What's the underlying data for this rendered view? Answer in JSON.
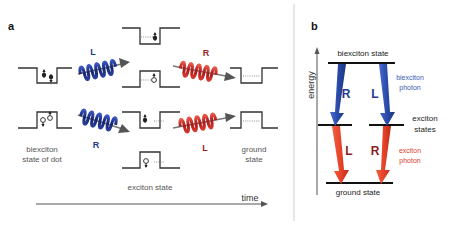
{
  "panel_a": {
    "label": "a",
    "captions": {
      "biexciton_line1": "biexciton",
      "biexciton_line2": "state of dot",
      "exciton": "exciton state",
      "ground_line1": "ground",
      "ground_line2": "state"
    },
    "photons": {
      "top_left": "L",
      "bottom_left": "R",
      "top_right": "R",
      "bottom_right": "L"
    },
    "time_axis": "time",
    "colors": {
      "biexciton_photon": "#1f3a8f",
      "exciton_photon": "#c0201c"
    }
  },
  "panel_b": {
    "label": "b",
    "energy_axis": "energy",
    "levels": {
      "biexciton": "biexciton state",
      "exciton_line1": "exciton",
      "exciton_line2": "states",
      "ground": "ground state"
    },
    "transitions": {
      "left_upper": "R",
      "right_upper": "L",
      "left_lower": "L",
      "right_lower": "R"
    },
    "photon_labels": {
      "biexciton_line1": "biexciton",
      "biexciton_line2": "photon",
      "exciton_line1": "exciton",
      "exciton_line2": "photon"
    },
    "colors": {
      "biexciton_arrow": "#2a4aa8",
      "exciton_arrow": "#e8432a"
    }
  }
}
